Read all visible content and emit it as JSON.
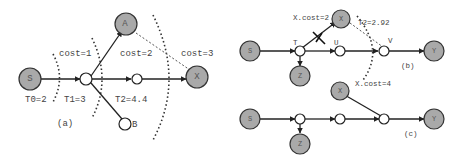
{
  "panel_a": {
    "caption": "(a)",
    "nodes": {
      "S": "S",
      "A": "A",
      "X": "X",
      "B": "B"
    },
    "cost_labels": [
      "cost=1",
      "cost=2",
      "cost=3"
    ],
    "threshold_labels": [
      "T0=2",
      "T1=3",
      "T2=4.4"
    ]
  },
  "panel_b": {
    "caption": "(b)",
    "nodes": {
      "S": "S",
      "T": "T",
      "U": "U",
      "V": "V",
      "X": "X",
      "Y": "Y",
      "Z": "Z"
    },
    "labels": {
      "x_cost_top": "X.cost=2",
      "threshold": "T2=2.92",
      "x_cost_bottom": "X.cost=4"
    }
  },
  "panel_c": {
    "caption": "(c)",
    "nodes": {
      "S": "S",
      "X": "X",
      "Y": "Y",
      "Z": "Z"
    }
  }
}
